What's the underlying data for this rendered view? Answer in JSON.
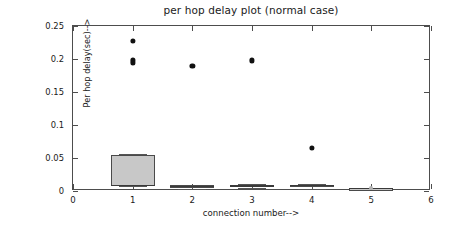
{
  "chart_data": {
    "type": "box",
    "title": "per hop delay plot (normal case)",
    "xlabel": "connection number-->",
    "ylabel": "Per hop delay(sec)-->",
    "xlim": [
      0,
      6
    ],
    "ylim": [
      0,
      0.25
    ],
    "grid": false,
    "legend": null,
    "xticks": [
      "0",
      "1",
      "2",
      "3",
      "4",
      "5",
      "6"
    ],
    "xtick_values": [
      0,
      1,
      2,
      3,
      4,
      5,
      6
    ],
    "yticks": [
      "0",
      "0.05",
      "0.1",
      "0.15",
      "0.2",
      "0.25"
    ],
    "ytick_values": [
      0,
      0.05,
      0.1,
      0.15,
      0.2,
      0.25
    ],
    "categories": [
      "1",
      "2",
      "3",
      "4",
      "5"
    ],
    "boxes": [
      {
        "category": "1",
        "x": 1,
        "q1": 0.008,
        "median": 0.0085,
        "q3": 0.055,
        "whisker_low": 0.007,
        "whisker_high": 0.0555,
        "outliers": [
          0.227,
          0.198,
          0.194
        ]
      },
      {
        "category": "2",
        "x": 2,
        "q1": 0.0055,
        "median": 0.0065,
        "q3": 0.0085,
        "whisker_low": 0.003,
        "whisker_high": 0.009,
        "outliers": [
          0.19
        ]
      },
      {
        "category": "3",
        "x": 3,
        "q1": 0.006,
        "median": 0.0075,
        "q3": 0.0095,
        "whisker_low": 0.004,
        "whisker_high": 0.0105,
        "outliers": [
          0.198
        ]
      },
      {
        "category": "4",
        "x": 4,
        "q1": 0.006,
        "median": 0.008,
        "q3": 0.0095,
        "whisker_low": 0.0035,
        "whisker_high": 0.011,
        "outliers": [
          0.065
        ]
      },
      {
        "category": "5",
        "x": 5,
        "q1": 0.004,
        "median": 0.004,
        "q3": 0.004,
        "whisker_low": 0.004,
        "whisker_high": 0.004,
        "outliers": [
          0.0045
        ]
      }
    ],
    "colors": {
      "box_fill": "#c8c8c8",
      "box_edge": "#4a4a4a",
      "median": "#3a3a3a",
      "whisker": "#555555",
      "outlier": "#111111",
      "axis": "#4d4d4d",
      "text": "#1a1a1a",
      "background": "#ffffff"
    }
  }
}
